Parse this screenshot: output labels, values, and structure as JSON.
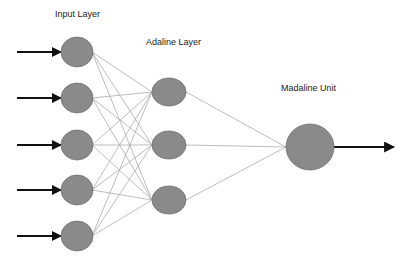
{
  "diagram": {
    "labels": {
      "input_layer": "Input Layer",
      "adaline_layer": "Adaline Layer",
      "madaline_unit": "Madaline Unit"
    },
    "input_nodes": [
      {
        "x": 77,
        "y": 52
      },
      {
        "x": 77,
        "y": 98
      },
      {
        "x": 77,
        "y": 145
      },
      {
        "x": 77,
        "y": 190
      },
      {
        "x": 77,
        "y": 236
      }
    ],
    "adaline_nodes": [
      {
        "x": 169,
        "y": 92
      },
      {
        "x": 169,
        "y": 145
      },
      {
        "x": 169,
        "y": 200
      }
    ],
    "madaline_node": {
      "x": 310,
      "y": 147
    },
    "colors": {
      "node_fill": "#8a8a8a",
      "node_stroke": "#6e6e6e",
      "edge": "#a0a0a0",
      "arrow": "#111111"
    }
  }
}
